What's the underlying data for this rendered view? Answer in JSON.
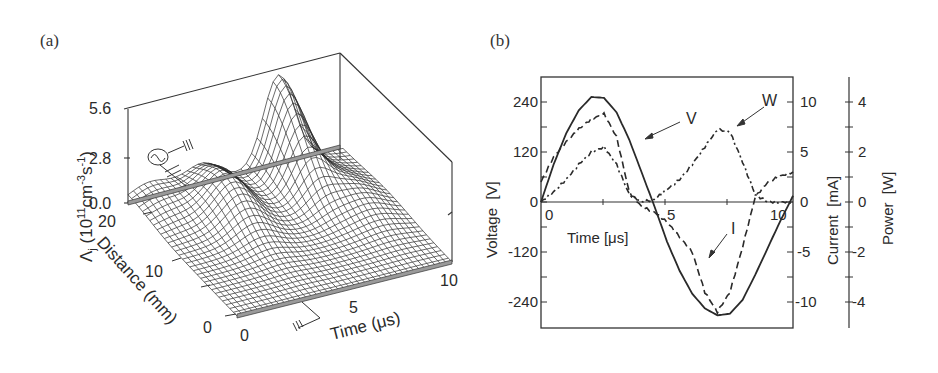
{
  "panels": {
    "a": {
      "label": "(a)",
      "z_axis_label": "Λj (10¹¹cm⁻³s⁻¹)",
      "z_label_main": "Λ",
      "z_label_sub": "j",
      "z_label_rest": " (10",
      "z_label_exp1": "11",
      "z_label_cm": "cm",
      "z_label_exp2": "-3",
      "z_label_s": "s",
      "z_label_exp3": "-1",
      "z_label_close": ")",
      "z_ticks": [
        "5.6",
        "2.8",
        "0.0"
      ],
      "distance_label": "Distance (mm)",
      "distance_ticks": [
        "20",
        "10",
        "0"
      ],
      "time_label": "Time (μs)",
      "time_ticks": [
        "0",
        "5",
        "10"
      ]
    },
    "b": {
      "label": "(b)",
      "voltage_label": "Voltage  [V]",
      "current_label": "Current  [mA]",
      "power_label": "Power  [W]",
      "time_label": "Time [μs]",
      "voltage_ticks": [
        "240",
        "120",
        "0",
        "-120",
        "-240"
      ],
      "current_ticks": [
        "10",
        "5",
        "0",
        "-5",
        "-10"
      ],
      "power_ticks": [
        "4",
        "2",
        "0",
        "-2",
        "-4"
      ],
      "time_ticks": [
        "0",
        "5",
        "10"
      ],
      "annotations": {
        "V": "V",
        "W": "W",
        "I": "I"
      }
    }
  },
  "chart_data": [
    {
      "type": "surface3d",
      "title": "(a)",
      "xlabel": "Time (μs)",
      "ylabel": "Distance (mm)",
      "zlabel": "Λj (10^11 cm^-3 s^-1)",
      "xlim": [
        0,
        10
      ],
      "ylim": [
        0,
        20
      ],
      "zlim": [
        0,
        5.6
      ],
      "x_ticks": [
        0,
        5,
        10
      ],
      "y_ticks": [
        0,
        10,
        20
      ],
      "z_ticks": [
        0.0,
        2.8,
        5.6
      ],
      "peaks": [
        {
          "time_us": 1.0,
          "distance_mm": 20,
          "height": 0.9
        },
        {
          "time_us": 3.3,
          "distance_mm": 15,
          "height": 2.0
        },
        {
          "time_us": 7.0,
          "distance_mm": 20,
          "height": 5.3
        },
        {
          "time_us": 8.5,
          "distance_mm": 12,
          "height": 1.0
        }
      ]
    },
    {
      "type": "line",
      "title": "(b)",
      "xlabel": "Time [μs]",
      "xlim": [
        0,
        10
      ],
      "axes": [
        {
          "name": "Voltage",
          "unit": "V",
          "ylim": [
            -300,
            300
          ],
          "ticks": [
            -240,
            -120,
            0,
            120,
            240
          ]
        },
        {
          "name": "Current",
          "unit": "mA",
          "ylim": [
            -12.5,
            12.5
          ],
          "ticks": [
            -10,
            -5,
            0,
            5,
            10
          ]
        },
        {
          "name": "Power",
          "unit": "W",
          "ylim": [
            -5,
            5
          ],
          "ticks": [
            -4,
            -2,
            0,
            2,
            4
          ]
        }
      ],
      "x": [
        0,
        0.5,
        1,
        1.5,
        2,
        2.5,
        3,
        3.5,
        4,
        4.5,
        5,
        5.5,
        6,
        6.5,
        7,
        7.5,
        8,
        8.5,
        9,
        9.5,
        10
      ],
      "series": [
        {
          "name": "V",
          "axis": "Voltage",
          "style": "solid",
          "values": [
            0,
            90,
            165,
            220,
            252,
            250,
            215,
            150,
            70,
            -10,
            -95,
            -165,
            -220,
            -255,
            -272,
            -268,
            -235,
            -175,
            -110,
            -45,
            15
          ]
        },
        {
          "name": "I",
          "axis": "Current",
          "style": "dashed",
          "values": [
            2,
            4.5,
            6.0,
            7.3,
            8.3,
            8.8,
            6.5,
            1.0,
            -0.5,
            -1.0,
            -2.0,
            -3.5,
            -5.0,
            -9.0,
            -11.0,
            -9.0,
            -4.5,
            0.5,
            2.0,
            2.6,
            3.0
          ]
        },
        {
          "name": "W",
          "axis": "Power",
          "style": "dash-dot",
          "values": [
            0,
            0.4,
            0.9,
            1.5,
            2.0,
            2.2,
            1.5,
            0.3,
            0,
            0.1,
            0.5,
            0.9,
            1.5,
            2.2,
            2.9,
            2.8,
            1.6,
            0.3,
            0,
            0,
            0
          ]
        }
      ]
    }
  ]
}
